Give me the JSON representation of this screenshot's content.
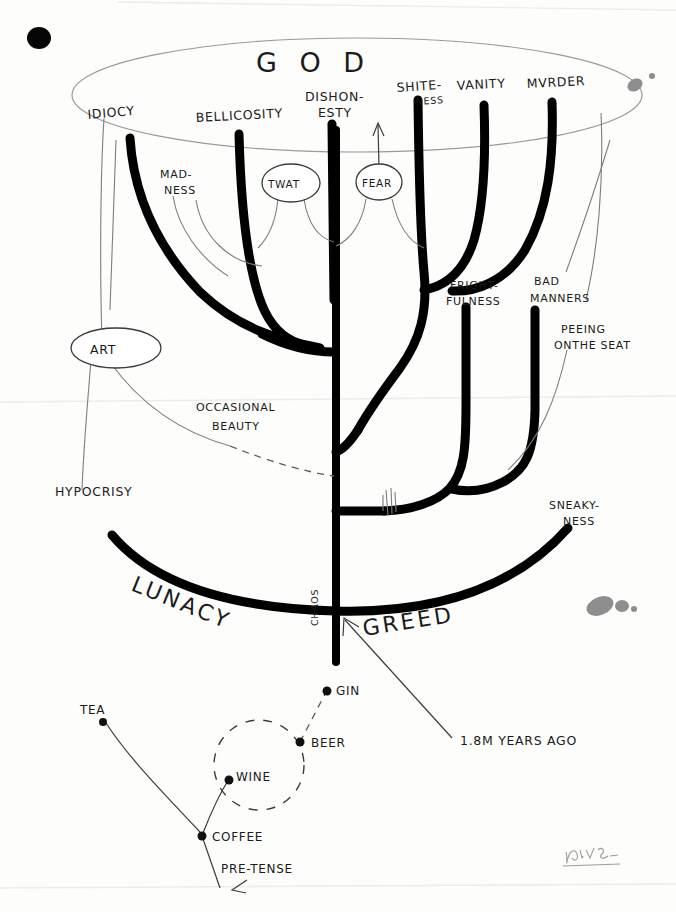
{
  "meta": {
    "signature": "Parris"
  },
  "crown": {
    "label": "G O D",
    "tips": [
      {
        "id": "idiocy",
        "label": "IDIOCY"
      },
      {
        "id": "bellicosity",
        "label": "BELLICOSITY"
      },
      {
        "id": "dishonesty",
        "label": "DISHON-\nESTY",
        "line1": "DISHON-",
        "line2": "ESTY"
      },
      {
        "id": "shiteness",
        "label": "SHITE-\nNESS",
        "line1": "SHITE-",
        "line2": "NESS"
      },
      {
        "id": "vanity",
        "label": "VANITY"
      },
      {
        "id": "murder",
        "label": "MVRDER"
      }
    ]
  },
  "bubbles": [
    {
      "id": "twat",
      "label": "TWAT"
    },
    {
      "id": "fear",
      "label": "FEAR"
    },
    {
      "id": "art",
      "label": "ART"
    }
  ],
  "annotations": [
    {
      "id": "madness",
      "line1": "MAD-",
      "line2": "NESS"
    },
    {
      "id": "frightfulness",
      "line1": "FRIGHT-",
      "line2": "FULNESS"
    },
    {
      "id": "badmanners",
      "line1": "BAD",
      "line2": "MANNERS"
    },
    {
      "id": "peeingontheseat",
      "line1": "PEEING",
      "line2": "ONTHE SEAT"
    },
    {
      "id": "occasionalbeauty",
      "line1": "OCCASIONAL",
      "line2": "BEAUTY"
    },
    {
      "id": "sneakyness",
      "line1": "SNEAKY-",
      "line2": "NESS"
    },
    {
      "id": "hypocrisy",
      "line1": "HYPOCRISY",
      "line2": ""
    }
  ],
  "base": {
    "left_label": "LUNACY",
    "right_label": "GREED",
    "root_label": "CHAOS",
    "callout": "1.8M YEARS AGO"
  },
  "drinks": {
    "nodes": [
      {
        "id": "tea",
        "label": "TEA"
      },
      {
        "id": "gin",
        "label": "GIN"
      },
      {
        "id": "beer",
        "label": "BEER"
      },
      {
        "id": "wine",
        "label": "WINE"
      },
      {
        "id": "coffee",
        "label": "COFFEE"
      },
      {
        "id": "pretense",
        "label": "PRE-TENSE"
      }
    ]
  },
  "colors": {
    "ink": "#000000",
    "pencil": "#7d7d7d",
    "smudge": "#8e8e8e",
    "paper": "#fdfdfc"
  }
}
